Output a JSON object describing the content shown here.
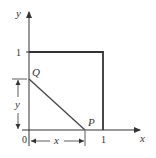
{
  "diagram": {
    "axes": {
      "x_label": "x",
      "y_label": "y",
      "origin_label": "0"
    },
    "ticks": {
      "x_one": "1",
      "y_one": "1"
    },
    "points": {
      "P": "P",
      "Q": "Q"
    },
    "dimensions": {
      "horizontal": "x",
      "vertical": "y"
    },
    "colors": {
      "square": "#333333",
      "segment": "#444444",
      "axes": "#333333"
    }
  }
}
